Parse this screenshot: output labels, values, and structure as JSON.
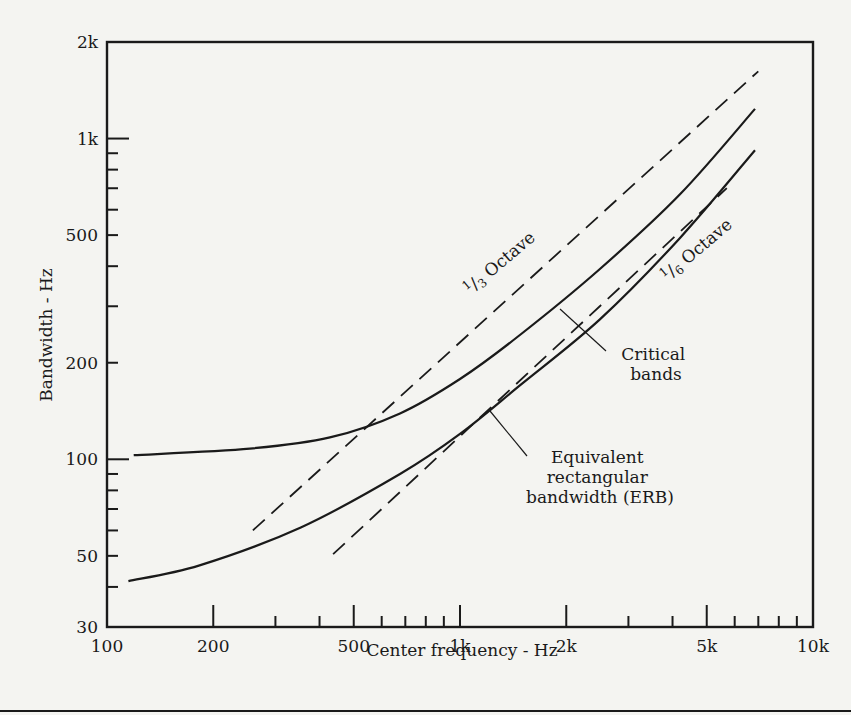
{
  "chart_data": {
    "type": "line",
    "title": "",
    "xlabel": "Center frequency - Hz",
    "ylabel": "Bandwidth - Hz",
    "xscale": "log",
    "yscale": "log",
    "xlim": [
      100,
      10000
    ],
    "ylim": [
      30,
      2000
    ],
    "grid": false,
    "legend": "inline annotations",
    "x_ticks": [
      {
        "value": 100,
        "label": "100"
      },
      {
        "value": 200,
        "label": "200"
      },
      {
        "value": 500,
        "label": "500"
      },
      {
        "value": 1000,
        "label": "1k"
      },
      {
        "value": 2000,
        "label": "2k"
      },
      {
        "value": 5000,
        "label": "5k"
      },
      {
        "value": 10000,
        "label": "10k"
      }
    ],
    "x_minor_ticks": [
      300,
      400,
      600,
      700,
      800,
      900,
      3000,
      4000,
      6000,
      7000,
      8000,
      9000
    ],
    "y_ticks": [
      {
        "value": 30,
        "label": "30"
      },
      {
        "value": 50,
        "label": "50"
      },
      {
        "value": 100,
        "label": "100"
      },
      {
        "value": 200,
        "label": "200"
      },
      {
        "value": 500,
        "label": "500"
      },
      {
        "value": 1000,
        "label": "1k"
      },
      {
        "value": 2000,
        "label": "2k"
      }
    ],
    "y_minor_ticks": [
      40,
      60,
      70,
      80,
      90,
      300,
      400,
      600,
      700,
      800,
      900
    ],
    "series": [
      {
        "name": "1/3 Octave",
        "style": "dashed",
        "x": [
          259,
          7000
        ],
        "y": [
          60,
          1621
        ]
      },
      {
        "name": "Critical bands",
        "style": "solid",
        "x": [
          119,
          254,
          428,
          676,
          1000,
          1478,
          2490,
          4200,
          6850
        ],
        "y": [
          103,
          108,
          117,
          139,
          178,
          244,
          392,
          670,
          1237
        ]
      },
      {
        "name": "Equivalent rectangular bandwidth (ERB)",
        "style": "solid",
        "x": [
          115,
          183,
          354,
          676,
          1000,
          1478,
          2490,
          4200,
          6850
        ],
        "y": [
          41.7,
          46.7,
          61.3,
          90,
          120,
          170,
          273,
          490,
          920
        ]
      },
      {
        "name": "1/6 Octave",
        "style": "dashed",
        "x": [
          437,
          5700
        ],
        "y": [
          50.6,
          700
        ]
      }
    ],
    "annotations": [
      {
        "text_pre": "1",
        "text_frac": "3",
        "text_post": " Octave",
        "target": "1/3 Octave"
      },
      {
        "text_pre": "1",
        "text_frac": "6",
        "text_post": " Octave",
        "target": "1/6 Octave"
      },
      {
        "lines": [
          "Critical",
          "bands"
        ],
        "target": "Critical bands"
      },
      {
        "lines": [
          "Equivalent",
          "rectangular",
          "bandwidth (ERB)"
        ],
        "target": "ERB"
      }
    ]
  }
}
